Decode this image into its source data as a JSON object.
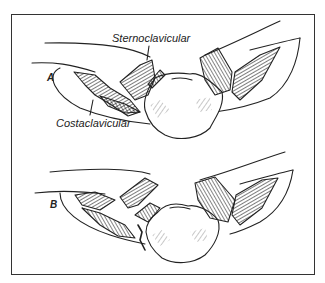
{
  "figure": {
    "panels": [
      {
        "id": "A",
        "label": "A"
      },
      {
        "id": "B",
        "label": "B"
      }
    ],
    "annotations": {
      "sternoclavicular": "Sternoclavicular",
      "costaclavicular": "Costaclavicular"
    },
    "colors": {
      "ink": "#222222",
      "border": "#333333",
      "background": "#ffffff"
    }
  }
}
